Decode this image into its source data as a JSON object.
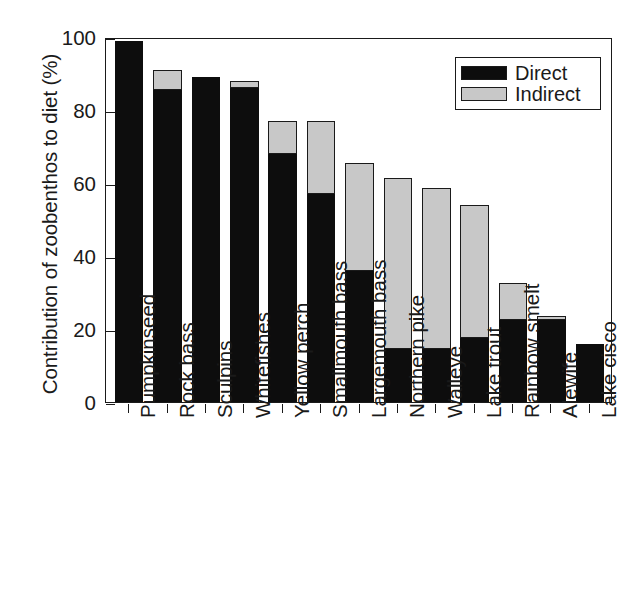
{
  "chart_data": {
    "type": "bar",
    "subtype": "stacked-bar",
    "title": "",
    "xlabel": "",
    "ylabel": "Contribution of zoobenthos to diet (%)",
    "ylim": [
      0,
      100
    ],
    "yticks": [
      0,
      20,
      40,
      60,
      80,
      100
    ],
    "ytick_labels": [
      "0",
      "20",
      "40",
      "60",
      "80",
      "100"
    ],
    "grid": false,
    "legend_position": "top-right",
    "categories": [
      "Pumpkinseed",
      "Rock bass",
      "Sculpins",
      "Whitefishes",
      "Yellow perch",
      "Smallmouth bass",
      "Largemouth bass",
      "Northern pike",
      "Walleye",
      "Lake trout",
      "Rainbow smelt",
      "Alewife",
      "Lake cisco"
    ],
    "series": [
      {
        "name": "Direct",
        "color": "#0d0d0d",
        "values": [
          99,
          85.5,
          89,
          86,
          68,
          57,
          36,
          14.5,
          14.5,
          17.5,
          22.5,
          22.5,
          16
        ]
      },
      {
        "name": "Indirect",
        "color": "#c8c8c8",
        "values": [
          0,
          5.5,
          0,
          2,
          9,
          20,
          29.5,
          47,
          44,
          36.5,
          10,
          1,
          0
        ]
      }
    ],
    "totals": [
      99,
      91,
      89,
      88,
      77,
      77,
      65.5,
      61.5,
      58.5,
      54,
      32.5,
      23.5,
      16
    ]
  },
  "legend": {
    "items": [
      {
        "label": "Direct",
        "swatch": "black-swatch"
      },
      {
        "label": "Indirect",
        "swatch": "gray-swatch"
      }
    ]
  },
  "colors": {
    "direct": "#0d0d0d",
    "indirect": "#c8c8c8",
    "axis": "#1a1a1a",
    "background": "#ffffff"
  }
}
